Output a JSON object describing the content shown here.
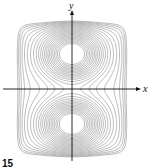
{
  "figure": {
    "number_label": "15",
    "x_axis_label": "x",
    "y_axis_label": "y",
    "colors": {
      "contour": "#8a8a8a",
      "axis": "#111111",
      "background": "#ffffff"
    }
  },
  "chart_data": {
    "type": "contour",
    "title": "",
    "xlabel": "x",
    "ylabel": "y",
    "grid": false,
    "centers": [
      [
        0,
        1
      ],
      [
        0,
        -1
      ]
    ],
    "saddle": [
      0,
      0
    ],
    "level_count": 22,
    "xlim": [
      -1.6,
      1.6
    ],
    "ylim": [
      -2,
      2
    ]
  }
}
